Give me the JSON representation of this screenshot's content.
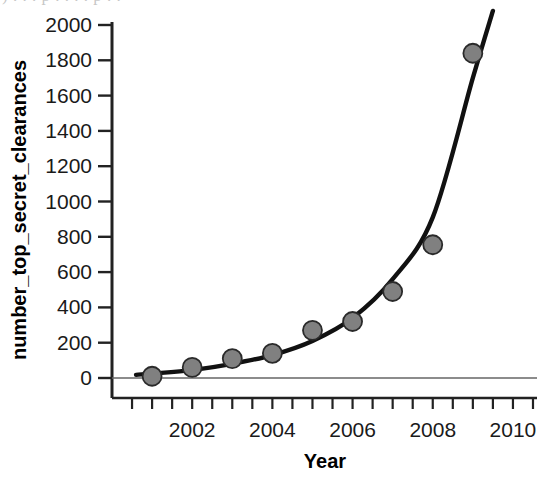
{
  "figure": {
    "width": 545,
    "height": 490,
    "background": "#ffffff",
    "cropped_text_above": ")  .  .    .      p .    .    . .  p . ."
  },
  "chart_data": {
    "type": "scatter",
    "title": "",
    "subtitle": "",
    "xlabel": "Year",
    "ylabel": "number_top_secret_clearances",
    "xlim": [
      2000.0,
      2010.6
    ],
    "ylim": [
      -120,
      2060
    ],
    "grid": false,
    "legend": null,
    "x": [
      2001,
      2002,
      2003,
      2004,
      2005,
      2006,
      2007,
      2008,
      2009
    ],
    "values": [
      10,
      60,
      110,
      140,
      270,
      320,
      490,
      755,
      1840
    ],
    "series": [
      {
        "name": "observed points",
        "type": "scatter",
        "marker": "circle",
        "marker_color": "#808080",
        "marker_edge_color": "#2a2a2a",
        "x": [
          2001,
          2002,
          2003,
          2004,
          2005,
          2006,
          2007,
          2008,
          2009
        ],
        "values": [
          10,
          60,
          110,
          140,
          270,
          320,
          490,
          755,
          1840
        ]
      },
      {
        "name": "exponential fit",
        "type": "line",
        "line_color": "#111111",
        "line_width": 4,
        "x": [
          2000.6,
          2001,
          2002,
          2003,
          2004,
          2005,
          2006,
          2007,
          2008,
          2009,
          2009.5
        ],
        "values": [
          18,
          25,
          45,
          80,
          130,
          210,
          340,
          560,
          910,
          1700,
          2080
        ]
      }
    ],
    "x_ticks_major": [
      2002,
      2004,
      2006,
      2008,
      2010
    ],
    "x_tick_labels": [
      "2002",
      "2004",
      "2006",
      "2008",
      "2010"
    ],
    "x_ticks_minor": [
      2000.5,
      2001,
      2001.5,
      2002,
      2002.5,
      2003,
      2003.5,
      2004,
      2004.5,
      2005,
      2005.5,
      2006,
      2006.5,
      2007,
      2007.5,
      2008,
      2008.5,
      2009,
      2009.5,
      2010,
      2010.5
    ],
    "y_ticks": [
      0,
      200,
      400,
      600,
      800,
      1000,
      1200,
      1400,
      1600,
      1800,
      2000
    ],
    "y_tick_labels": [
      "0",
      "200",
      "400",
      "600",
      "800",
      "1000",
      "1200",
      "1400",
      "1600",
      "1800",
      "2000"
    ],
    "zero_line": true,
    "zero_line_color": "#555555",
    "axis_color": "#222222"
  }
}
